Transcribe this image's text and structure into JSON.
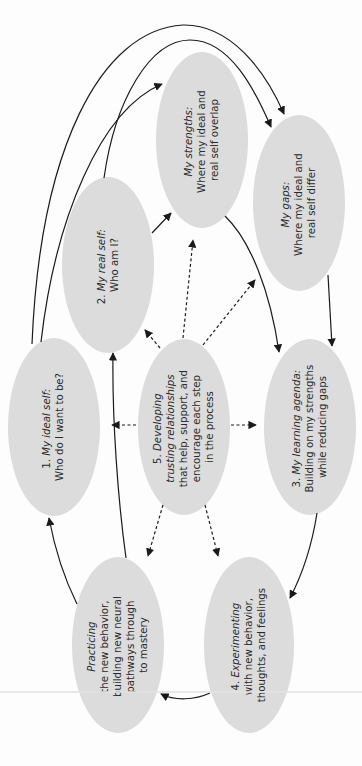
{
  "diagram": {
    "type": "cycle-flow",
    "orientation": "rotated-90-ccw",
    "colors": {
      "node_fill": "#dcdcdc",
      "line": "#1a1a1a",
      "background": "#fdfdfd"
    },
    "nodes": [
      {
        "id": "ideal_self",
        "lines": [
          {
            "prefix": "1. ",
            "italic": "My ideal self:",
            "suffix": ""
          },
          {
            "prefix": "Who do I want to be?",
            "italic": "",
            "suffix": ""
          }
        ]
      },
      {
        "id": "real_self",
        "lines": [
          {
            "prefix": "2. ",
            "italic": "My real self:",
            "suffix": ""
          },
          {
            "prefix": "Who am I?",
            "italic": "",
            "suffix": ""
          }
        ]
      },
      {
        "id": "strengths",
        "lines": [
          {
            "prefix": "",
            "italic": "My strengths:",
            "suffix": ""
          },
          {
            "prefix": "Where my ideal and",
            "italic": "",
            "suffix": ""
          },
          {
            "prefix": "real self overlap",
            "italic": "",
            "suffix": ""
          }
        ]
      },
      {
        "id": "gaps",
        "lines": [
          {
            "prefix": "",
            "italic": "My gaps:",
            "suffix": ""
          },
          {
            "prefix": "Where my ideal and",
            "italic": "",
            "suffix": ""
          },
          {
            "prefix": "real self differ",
            "italic": "",
            "suffix": ""
          }
        ]
      },
      {
        "id": "learning_agenda",
        "lines": [
          {
            "prefix": "3. ",
            "italic": "My learning agenda:",
            "suffix": ""
          },
          {
            "prefix": "Building on my strengths",
            "italic": "",
            "suffix": ""
          },
          {
            "prefix": "while reducing gaps",
            "italic": "",
            "suffix": ""
          }
        ]
      },
      {
        "id": "experimenting",
        "lines": [
          {
            "prefix": "4. ",
            "italic": "Experimenting",
            "suffix": ""
          },
          {
            "prefix": "with new behavior,",
            "italic": "",
            "suffix": ""
          },
          {
            "prefix": "thoughts, and feelings",
            "italic": "",
            "suffix": ""
          }
        ]
      },
      {
        "id": "practicing",
        "lines": [
          {
            "prefix": "",
            "italic": "Practicing",
            "suffix": ""
          },
          {
            "prefix": "the new behavior,",
            "italic": "",
            "suffix": ""
          },
          {
            "prefix": "building new neural",
            "italic": "",
            "suffix": ""
          },
          {
            "prefix": "pathways through",
            "italic": "",
            "suffix": ""
          },
          {
            "prefix": "to mastery",
            "italic": "",
            "suffix": ""
          }
        ]
      },
      {
        "id": "relationships",
        "lines": [
          {
            "prefix": "5. ",
            "italic": "Developing",
            "suffix": ""
          },
          {
            "prefix": "",
            "italic": "trusting relationships",
            "suffix": ""
          },
          {
            "prefix": "that help, support, and",
            "italic": "",
            "suffix": ""
          },
          {
            "prefix": "encourage each step",
            "italic": "",
            "suffix": ""
          },
          {
            "prefix": "in the process",
            "italic": "",
            "suffix": ""
          }
        ]
      }
    ],
    "edges": [
      {
        "from": "ideal_self",
        "to": "gaps",
        "style": "solid"
      },
      {
        "from": "ideal_self",
        "to": "strengths",
        "style": "solid"
      },
      {
        "from": "real_self",
        "to": "gaps",
        "style": "solid"
      },
      {
        "from": "real_self",
        "to": "strengths",
        "style": "solid"
      },
      {
        "from": "strengths",
        "to": "learning_agenda",
        "style": "solid"
      },
      {
        "from": "gaps",
        "to": "learning_agenda",
        "style": "solid"
      },
      {
        "from": "learning_agenda",
        "to": "experimenting",
        "style": "solid"
      },
      {
        "from": "experimenting",
        "to": "practicing",
        "style": "solid"
      },
      {
        "from": "practicing",
        "to": "ideal_self",
        "style": "solid"
      },
      {
        "from": "practicing",
        "to": "real_self",
        "style": "solid"
      },
      {
        "from": "relationships",
        "to": "ideal_self",
        "style": "dashed"
      },
      {
        "from": "relationships",
        "to": "real_self",
        "style": "dashed"
      },
      {
        "from": "relationships",
        "to": "strengths",
        "style": "dashed"
      },
      {
        "from": "relationships",
        "to": "gaps",
        "style": "dashed"
      },
      {
        "from": "relationships",
        "to": "learning_agenda",
        "style": "dashed"
      },
      {
        "from": "relationships",
        "to": "experimenting",
        "style": "dashed"
      },
      {
        "from": "relationships",
        "to": "practicing",
        "style": "dashed"
      }
    ]
  }
}
